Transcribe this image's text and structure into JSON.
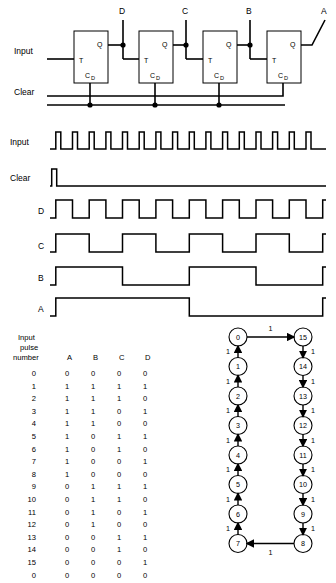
{
  "circuit": {
    "input_label": "Input",
    "clear_label": "Clear",
    "flipflops": [
      {
        "id": "ff-d",
        "t_label": "T",
        "q_label": "Q",
        "cd_label": "C",
        "cd_sub": "D",
        "output": "D"
      },
      {
        "id": "ff-c",
        "t_label": "T",
        "q_label": "Q",
        "cd_label": "C",
        "cd_sub": "D",
        "output": "C"
      },
      {
        "id": "ff-b",
        "t_label": "T",
        "q_label": "Q",
        "cd_label": "C",
        "cd_sub": "D",
        "output": "B"
      },
      {
        "id": "ff-a",
        "t_label": "T",
        "q_label": "Q",
        "cd_label": "C",
        "cd_sub": "D",
        "output": "A"
      }
    ],
    "outputs": [
      "D",
      "C",
      "B",
      "A"
    ]
  },
  "timing": {
    "rows": [
      {
        "name": "Input",
        "type": "pulses",
        "pulses": 16
      },
      {
        "name": "Clear",
        "type": "single-pulse",
        "pulses": 1
      },
      {
        "name": "D",
        "type": "square",
        "period": 2
      },
      {
        "name": "C",
        "type": "square",
        "period": 4
      },
      {
        "name": "B",
        "type": "square",
        "period": 8
      },
      {
        "name": "A",
        "type": "square",
        "period": 16
      }
    ]
  },
  "table": {
    "header_lines": [
      "Input",
      "pulse",
      "number"
    ],
    "columns": [
      "A",
      "B",
      "C",
      "D"
    ],
    "rows": [
      {
        "n": "0",
        "a": "0",
        "b": "0",
        "c": "0",
        "d": "0"
      },
      {
        "n": "1",
        "a": "1",
        "b": "1",
        "c": "1",
        "d": "1"
      },
      {
        "n": "2",
        "a": "1",
        "b": "1",
        "c": "1",
        "d": "0"
      },
      {
        "n": "3",
        "a": "1",
        "b": "1",
        "c": "0",
        "d": "1"
      },
      {
        "n": "4",
        "a": "1",
        "b": "1",
        "c": "0",
        "d": "0"
      },
      {
        "n": "5",
        "a": "1",
        "b": "0",
        "c": "1",
        "d": "1"
      },
      {
        "n": "6",
        "a": "1",
        "b": "0",
        "c": "1",
        "d": "0"
      },
      {
        "n": "7",
        "a": "1",
        "b": "0",
        "c": "0",
        "d": "1"
      },
      {
        "n": "8",
        "a": "1",
        "b": "0",
        "c": "0",
        "d": "0"
      },
      {
        "n": "9",
        "a": "0",
        "b": "1",
        "c": "1",
        "d": "1"
      },
      {
        "n": "10",
        "a": "0",
        "b": "1",
        "c": "1",
        "d": "0"
      },
      {
        "n": "11",
        "a": "0",
        "b": "1",
        "c": "0",
        "d": "1"
      },
      {
        "n": "12",
        "a": "0",
        "b": "1",
        "c": "0",
        "d": "0"
      },
      {
        "n": "13",
        "a": "0",
        "b": "0",
        "c": "1",
        "d": "1"
      },
      {
        "n": "14",
        "a": "0",
        "b": "0",
        "c": "1",
        "d": "0"
      },
      {
        "n": "15",
        "a": "0",
        "b": "0",
        "c": "0",
        "d": "1"
      },
      {
        "n": "0",
        "a": "0",
        "b": "0",
        "c": "0",
        "d": "0"
      }
    ]
  },
  "state_diagram": {
    "left_column": [
      "0",
      "1",
      "2",
      "3",
      "4",
      "5",
      "6",
      "7"
    ],
    "right_column": [
      "15",
      "14",
      "13",
      "12",
      "11",
      "10",
      "9",
      "8"
    ],
    "edge_label": "1",
    "top_edge": {
      "from": "0",
      "to": "15",
      "label": "1"
    },
    "bottom_edge": {
      "from": "8",
      "to": "7",
      "label": "1"
    },
    "edge_labels_left": [
      "1",
      "1",
      "1",
      "1",
      "1",
      "1",
      "1"
    ],
    "edge_labels_right": [
      "1",
      "1",
      "1",
      "1",
      "1",
      "1",
      "1"
    ]
  },
  "colors": {
    "ink": "#000000",
    "background": "#ffffff"
  }
}
